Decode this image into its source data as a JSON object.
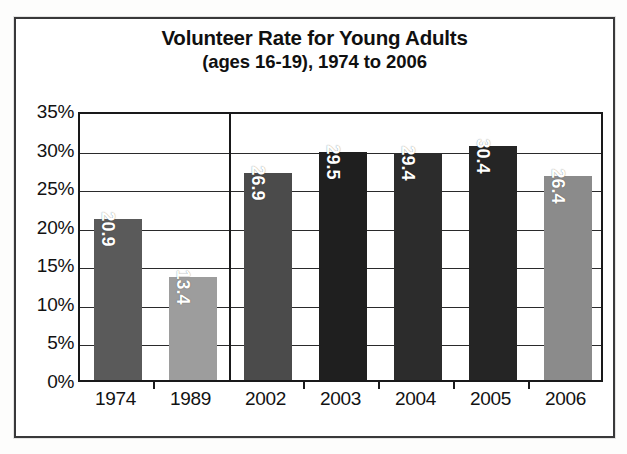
{
  "figure": {
    "title_line_1": "Volunteer Rate for Young Adults",
    "title_line_2": "(ages 16-19), 1974 to 2006",
    "frame_color": "#39393a",
    "plot_border_color": "#19191a",
    "gridline_color": "#2a2a2b",
    "background_color": "#ffffff"
  },
  "y_axis": {
    "ticks": [
      "35%",
      "30%",
      "25%",
      "20%",
      "15%",
      "10%",
      "5%",
      "0%"
    ],
    "tick_values": [
      35,
      30,
      25,
      20,
      15,
      10,
      5,
      0
    ],
    "min": 0,
    "max": 35,
    "step": 5,
    "unit": "%"
  },
  "x_axis": {
    "ticks": [
      "1974",
      "1989",
      "2002",
      "2003",
      "2004",
      "2005",
      "2006"
    ]
  },
  "bars": [
    {
      "category": "1974",
      "label": "20.9",
      "value": 20.9,
      "color": "#5a5a5a"
    },
    {
      "category": "1989",
      "label": "13.4",
      "value": 13.4,
      "color": "#9d9d9d"
    },
    {
      "category": "2002",
      "label": "26.9",
      "value": 26.9,
      "color": "#4b4b4b"
    },
    {
      "category": "2003",
      "label": "29.5",
      "value": 29.5,
      "color": "#1f1f1f"
    },
    {
      "category": "2004",
      "label": "29.4",
      "value": 29.4,
      "color": "#2c2c2c"
    },
    {
      "category": "2005",
      "label": "30.4",
      "value": 30.4,
      "color": "#252525"
    },
    {
      "category": "2006",
      "label": "26.4",
      "value": 26.4,
      "color": "#8b8b8b"
    }
  ],
  "chart_data": {
    "type": "bar",
    "title": "Volunteer Rate for Young Adults (ages 16-19), 1974 to 2006",
    "subtitle": "(ages 16-19), 1974 to 2006",
    "xlabel": "",
    "ylabel": "",
    "categories": [
      "1974",
      "1989",
      "2002",
      "2003",
      "2004",
      "2005",
      "2006"
    ],
    "values": [
      20.9,
      13.4,
      26.9,
      29.5,
      29.4,
      30.4,
      26.4
    ],
    "value_labels": [
      "20.9",
      "13.4",
      "26.9",
      "29.5",
      "29.4",
      "30.4",
      "26.4"
    ],
    "ylim": [
      0,
      35
    ],
    "ytick_labels": [
      "0%",
      "5%",
      "10%",
      "15%",
      "20%",
      "25%",
      "30%",
      "35%"
    ],
    "ytick_values": [
      0,
      5,
      10,
      15,
      20,
      25,
      30,
      35
    ],
    "unit": "percent",
    "grid": "horizontal",
    "legend": "none",
    "annotations": [
      "vertical separator line between 1989 and 2002 groups"
    ],
    "bar_colors": [
      "#5a5a5a",
      "#9d9d9d",
      "#4b4b4b",
      "#1f1f1f",
      "#2c2c2c",
      "#252525",
      "#8b8b8b"
    ],
    "label_placement": "inside-top-rotated-vertical-white"
  }
}
